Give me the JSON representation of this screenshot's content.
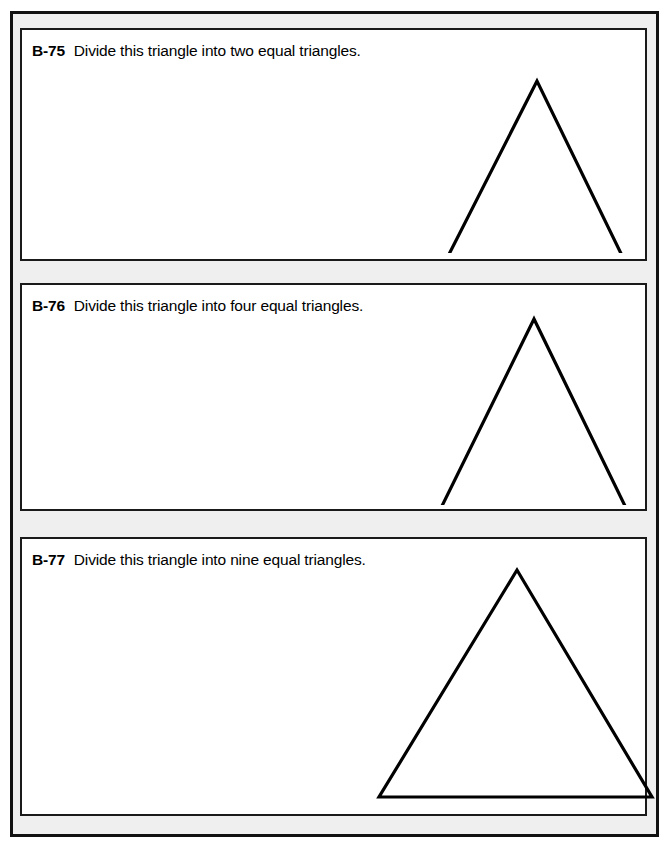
{
  "page": {
    "background_color": "#ffffff",
    "frame_color": "#111111",
    "gutter_color": "#efefef",
    "panel_background": "#ffffff",
    "panel_border_color": "#1a1a1a",
    "figure_stroke_color": "#000000"
  },
  "problems": [
    {
      "id": "b75",
      "number": "B-75",
      "text": "Divide this triangle into two equal triangles.",
      "figure": {
        "name": "triangle",
        "points": "127,43 30,234 220,234",
        "viewbox": "0 0 235 215"
      }
    },
    {
      "id": "b76",
      "number": "B-76",
      "text": "Divide this triangle into four equal triangles.",
      "figure": {
        "name": "triangle",
        "points": "124,29 30,220 217,220",
        "viewbox": "0 0 235 215"
      }
    },
    {
      "id": "b77",
      "number": "B-77",
      "text": "Divide this triangle into nine equal triangles.",
      "figure": {
        "name": "triangle",
        "points": "167,21 29,248 302,248",
        "viewbox": "0 0 315 255"
      }
    }
  ]
}
